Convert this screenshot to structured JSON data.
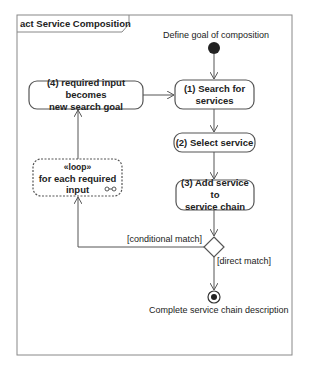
{
  "diagram": {
    "type": "UML activity diagram",
    "frame_title": "act Service Composition",
    "start_label": "Define goal of composition",
    "end_label": "Complete service chain description",
    "actions": [
      {
        "id": "a1",
        "line1": "(1) Search for",
        "line2": "services"
      },
      {
        "id": "a2",
        "line1": "(2) Select service",
        "line2": ""
      },
      {
        "id": "a3",
        "line1": "(3) Add service to",
        "line2": "service chain"
      },
      {
        "id": "a4",
        "line1": "(4) required input becomes",
        "line2": "new search goal"
      }
    ],
    "loop_node": {
      "stereotype": "«loop»",
      "line1": "for each required",
      "line2": "input",
      "icon": "loop-infinity-icon"
    },
    "guards": {
      "conditional": "[conditional match]",
      "direct": "[direct match]"
    },
    "colors": {
      "stroke": "#555555",
      "text": "#222222",
      "frame": "#888888",
      "background": "#ffffff"
    }
  }
}
